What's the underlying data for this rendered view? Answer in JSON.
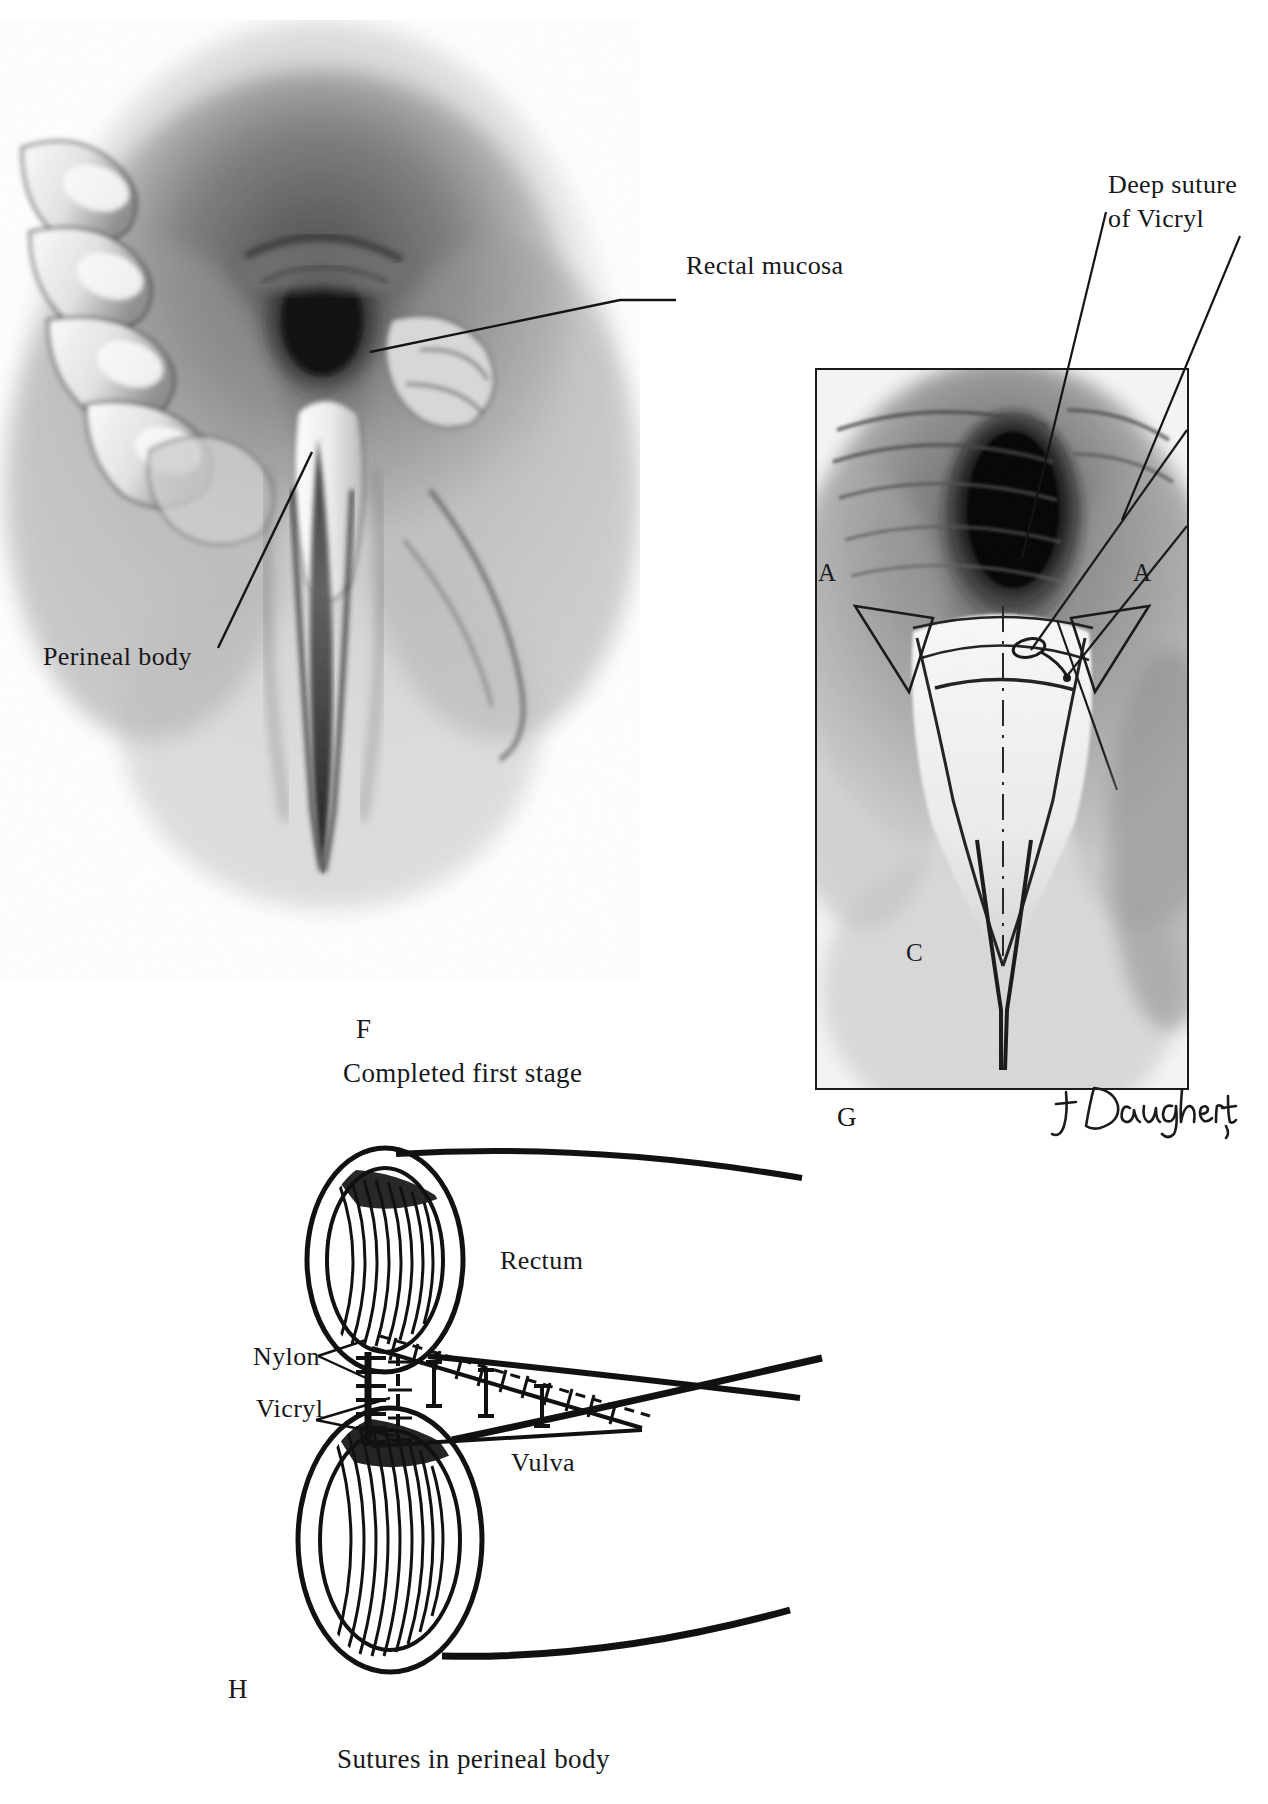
{
  "plate": {
    "kind": "medical-illustration-plate",
    "width": 1268,
    "height": 1804,
    "background": "#ffffff",
    "ink": "#17171a"
  },
  "figure_f": {
    "letter": "F",
    "caption": "Completed first stage",
    "annotations": [
      {
        "id": "rectal-mucosa",
        "text": "Rectal mucosa"
      },
      {
        "id": "perineal-body",
        "text": "Perineal body"
      }
    ]
  },
  "figure_g": {
    "letter": "G",
    "annotation": "Deep suture\nof Vicryl",
    "annotation_line1": "Deep suture",
    "annotation_line2": "of Vicryl",
    "inset_letters": {
      "left_a": "A",
      "right_a": "A",
      "bottom_c": "C"
    }
  },
  "figure_h": {
    "letter": "H",
    "caption": "Sutures in perineal body",
    "labels": {
      "rectum": "Rectum",
      "vulva": "Vulva",
      "nylon": "Nylon",
      "vicryl": "Vicryl"
    }
  },
  "credit": {
    "artist_signature": "J. Daugherty"
  }
}
